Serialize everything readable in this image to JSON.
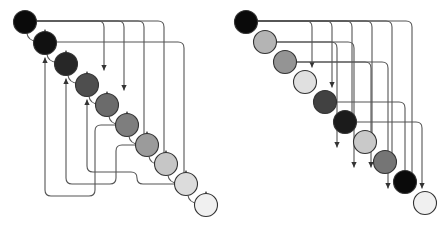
{
  "figure": {
    "type": "diagram",
    "title": "",
    "background_color": "#ffffff",
    "edge_color": "#555555",
    "node_stroke_color": "#333333",
    "width": 448,
    "height": 229,
    "panel_count": 2
  },
  "panels": [
    {
      "id": "left",
      "name": "left-diagram",
      "origin_x": 0,
      "node_radius": 11.5,
      "nodes": [
        {
          "index": 0,
          "label": "",
          "cx": 25,
          "cy": 22,
          "fill": "#0a0a0a"
        },
        {
          "index": 1,
          "label": "",
          "cx": 45,
          "cy": 43,
          "fill": "#111111"
        },
        {
          "index": 2,
          "label": "",
          "cx": 66,
          "cy": 64,
          "fill": "#272727"
        },
        {
          "index": 3,
          "label": "",
          "cx": 87,
          "cy": 85,
          "fill": "#4e4e4e"
        },
        {
          "index": 4,
          "label": "",
          "cx": 107,
          "cy": 105,
          "fill": "#6b6b6b"
        },
        {
          "index": 5,
          "label": "",
          "cx": 127,
          "cy": 125,
          "fill": "#7e7e7e"
        },
        {
          "index": 6,
          "label": "",
          "cx": 147,
          "cy": 145,
          "fill": "#9b9b9b"
        },
        {
          "index": 7,
          "label": "",
          "cx": 166,
          "cy": 164,
          "fill": "#c6c6c6"
        },
        {
          "index": 8,
          "label": "",
          "cx": 186,
          "cy": 184,
          "fill": "#dcdcdc"
        },
        {
          "index": 9,
          "label": "",
          "cx": 206,
          "cy": 205,
          "fill": "#f0f0f0"
        }
      ],
      "edges": [
        {
          "from": 0,
          "to": 1,
          "kind": "short-hop"
        },
        {
          "from": 1,
          "to": 2,
          "kind": "short-hop"
        },
        {
          "from": 2,
          "to": 3,
          "kind": "short-hop"
        },
        {
          "from": 3,
          "to": 4,
          "kind": "short-hop"
        },
        {
          "from": 4,
          "to": 5,
          "kind": "short-hop"
        },
        {
          "from": 5,
          "to": 6,
          "kind": "short-hop"
        },
        {
          "from": 6,
          "to": 7,
          "kind": "short-hop"
        },
        {
          "from": 7,
          "to": 8,
          "kind": "short-hop"
        },
        {
          "from": 8,
          "to": 9,
          "kind": "short-hop"
        },
        {
          "from": 0,
          "to": 3,
          "kind": "long-top"
        },
        {
          "from": 0,
          "to": 4,
          "kind": "long-top"
        },
        {
          "from": 0,
          "to": 7,
          "kind": "long-top"
        },
        {
          "from": 0,
          "to": 8,
          "kind": "long-top"
        },
        {
          "from": 1,
          "to": 9,
          "kind": "long-top"
        },
        {
          "from": 5,
          "to": 1,
          "kind": "back-left"
        },
        {
          "from": 6,
          "to": 2,
          "kind": "back-left"
        },
        {
          "from": 8,
          "to": 3,
          "kind": "back-left"
        }
      ]
    },
    {
      "id": "right",
      "name": "right-diagram",
      "origin_x": 224,
      "node_radius": 11.5,
      "nodes": [
        {
          "index": 0,
          "label": "",
          "cx": 22,
          "cy": 22,
          "fill": "#0a0a0a"
        },
        {
          "index": 1,
          "label": "",
          "cx": 41,
          "cy": 42,
          "fill": "#b4b4b4"
        },
        {
          "index": 2,
          "label": "",
          "cx": 61,
          "cy": 62,
          "fill": "#949494"
        },
        {
          "index": 3,
          "label": "",
          "cx": 81,
          "cy": 82,
          "fill": "#e0e0e0"
        },
        {
          "index": 4,
          "label": "",
          "cx": 101,
          "cy": 102,
          "fill": "#414141"
        },
        {
          "index": 5,
          "label": "",
          "cx": 121,
          "cy": 122,
          "fill": "#1b1b1b"
        },
        {
          "index": 6,
          "label": "",
          "cx": 141,
          "cy": 142,
          "fill": "#c9c9c9"
        },
        {
          "index": 7,
          "label": "",
          "cx": 161,
          "cy": 162,
          "fill": "#757575"
        },
        {
          "index": 8,
          "label": "",
          "cx": 181,
          "cy": 182,
          "fill": "#0a0a0a"
        },
        {
          "index": 9,
          "label": "",
          "cx": 201,
          "cy": 203,
          "fill": "#f0f0f0"
        }
      ],
      "edges": [
        {
          "from": 0,
          "to": 3,
          "kind": "long-top"
        },
        {
          "from": 0,
          "to": 4,
          "kind": "long-top"
        },
        {
          "from": 0,
          "to": 6,
          "kind": "long-top"
        },
        {
          "from": 0,
          "to": 7,
          "kind": "long-top"
        },
        {
          "from": 0,
          "to": 8,
          "kind": "long-top"
        },
        {
          "from": 0,
          "to": 9,
          "kind": "long-top"
        },
        {
          "from": 1,
          "to": 7,
          "kind": "row-right"
        },
        {
          "from": 1,
          "to": 8,
          "kind": "row-right"
        },
        {
          "from": 2,
          "to": 8,
          "kind": "row-right"
        },
        {
          "from": 2,
          "to": 9,
          "kind": "row-right"
        },
        {
          "from": 4,
          "to": 9,
          "kind": "row-right"
        },
        {
          "from": 5,
          "to": 9,
          "kind": "row-right"
        }
      ]
    }
  ]
}
